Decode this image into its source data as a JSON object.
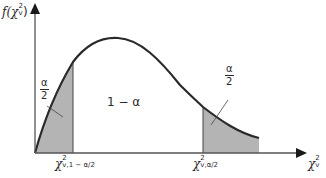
{
  "diagram": {
    "type": "chi-squared probability density with two-tailed critical regions",
    "y_axis_label": {
      "base": "f(χ",
      "sup": "2",
      "sub": "v",
      "close": ")"
    },
    "x_axis_label": {
      "base": "χ",
      "sup": "2",
      "sub": "v"
    },
    "left_tail_area": {
      "numerator": "α",
      "denominator": "2"
    },
    "center_area": "1 − α",
    "right_tail_area": {
      "numerator": "α",
      "denominator": "2"
    },
    "lower_critical": {
      "base": "χ",
      "sup": "2",
      "sub": "v,1 − α/2"
    },
    "upper_critical": {
      "base": "χ",
      "sup": "2",
      "sub": "v,α/2"
    },
    "colors": {
      "curve": "#2a2a2a",
      "axis": "#555555",
      "shade": "#b4b4b4"
    }
  }
}
